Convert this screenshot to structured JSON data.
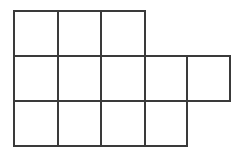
{
  "figure": {
    "name": "polyomino-grid",
    "canvas": {
      "width": 240,
      "height": 152
    },
    "background_color": "#ffffff",
    "line_color": "#3a3a3a",
    "line_width": 2,
    "cell_count": 12,
    "column_edges_px": [
      14,
      58,
      101,
      145,
      187,
      230
    ],
    "row_edges_px": [
      11,
      56,
      101,
      146
    ],
    "rows": [
      {
        "index": 0,
        "label": "top-row",
        "cell_columns": [
          0,
          1,
          2
        ],
        "cell_count": 3
      },
      {
        "index": 1,
        "label": "middle-row",
        "cell_columns": [
          0,
          1,
          2,
          3,
          4
        ],
        "cell_count": 5
      },
      {
        "index": 2,
        "label": "bottom-row",
        "cell_columns": [
          0,
          1,
          2,
          3
        ],
        "cell_count": 4
      }
    ],
    "cells": [
      {
        "id": "r0c0",
        "row": 0,
        "col": 0,
        "x": 14,
        "y": 11,
        "w": 44,
        "h": 45
      },
      {
        "id": "r0c1",
        "row": 0,
        "col": 1,
        "x": 58,
        "y": 11,
        "w": 43,
        "h": 45
      },
      {
        "id": "r0c2",
        "row": 0,
        "col": 2,
        "x": 101,
        "y": 11,
        "w": 44,
        "h": 45
      },
      {
        "id": "r1c0",
        "row": 1,
        "col": 0,
        "x": 14,
        "y": 56,
        "w": 44,
        "h": 45
      },
      {
        "id": "r1c1",
        "row": 1,
        "col": 1,
        "x": 58,
        "y": 56,
        "w": 43,
        "h": 45
      },
      {
        "id": "r1c2",
        "row": 1,
        "col": 2,
        "x": 101,
        "y": 56,
        "w": 44,
        "h": 45
      },
      {
        "id": "r1c3",
        "row": 1,
        "col": 3,
        "x": 145,
        "y": 56,
        "w": 42,
        "h": 45
      },
      {
        "id": "r1c4",
        "row": 1,
        "col": 4,
        "x": 187,
        "y": 56,
        "w": 43,
        "h": 45
      },
      {
        "id": "r2c0",
        "row": 2,
        "col": 0,
        "x": 14,
        "y": 101,
        "w": 44,
        "h": 45
      },
      {
        "id": "r2c1",
        "row": 2,
        "col": 1,
        "x": 58,
        "y": 101,
        "w": 43,
        "h": 45
      },
      {
        "id": "r2c2",
        "row": 2,
        "col": 2,
        "x": 101,
        "y": 101,
        "w": 44,
        "h": 45
      },
      {
        "id": "r2c3",
        "row": 2,
        "col": 3,
        "x": 145,
        "y": 101,
        "w": 42,
        "h": 45
      }
    ],
    "segments": [
      {
        "id": "h-top-row0",
        "orientation": "horizontal",
        "x1": 14,
        "y1": 11,
        "x2": 145,
        "y2": 11
      },
      {
        "id": "h-row0-row1",
        "orientation": "horizontal",
        "x1": 14,
        "y1": 56,
        "x2": 230,
        "y2": 56
      },
      {
        "id": "h-row1-row2",
        "orientation": "horizontal",
        "x1": 14,
        "y1": 101,
        "x2": 230,
        "y2": 101
      },
      {
        "id": "h-bottom-row2",
        "orientation": "horizontal",
        "x1": 14,
        "y1": 146,
        "x2": 187,
        "y2": 146
      },
      {
        "id": "v-col0-left",
        "orientation": "vertical",
        "x1": 14,
        "y1": 11,
        "x2": 14,
        "y2": 146
      },
      {
        "id": "v-col1",
        "orientation": "vertical",
        "x1": 58,
        "y1": 11,
        "x2": 58,
        "y2": 146
      },
      {
        "id": "v-col2",
        "orientation": "vertical",
        "x1": 101,
        "y1": 11,
        "x2": 101,
        "y2": 146
      },
      {
        "id": "v-col3",
        "orientation": "vertical",
        "x1": 145,
        "y1": 11,
        "x2": 145,
        "y2": 146
      },
      {
        "id": "v-col4",
        "orientation": "vertical",
        "x1": 187,
        "y1": 56,
        "x2": 187,
        "y2": 146
      },
      {
        "id": "v-col5-right",
        "orientation": "vertical",
        "x1": 230,
        "y1": 56,
        "x2": 230,
        "y2": 101
      }
    ]
  }
}
